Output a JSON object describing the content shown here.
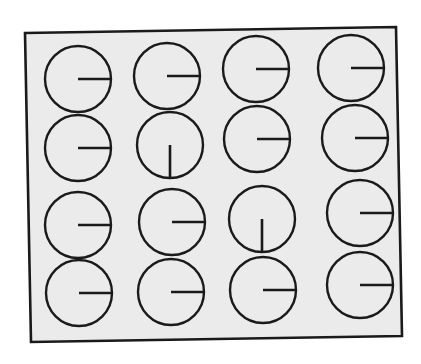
{
  "diagram": {
    "type": "visual-search-stimulus",
    "grid": {
      "rows": 4,
      "cols": 4
    },
    "colors": {
      "background": "#ffffff",
      "panel_fill": "#ebebeb",
      "stroke": "#1a1a1a"
    },
    "frame": {
      "corners": [
        [
          25,
          33
        ],
        [
          396,
          27
        ],
        [
          402,
          336
        ],
        [
          31,
          342
        ]
      ]
    },
    "circle_radius": 33,
    "items": [
      {
        "row": 1,
        "col": 1,
        "cx": 78,
        "cy": 79,
        "line_direction": "right"
      },
      {
        "row": 1,
        "col": 2,
        "cx": 167,
        "cy": 76,
        "line_direction": "right"
      },
      {
        "row": 1,
        "col": 3,
        "cx": 256,
        "cy": 69,
        "line_direction": "right"
      },
      {
        "row": 1,
        "col": 4,
        "cx": 351,
        "cy": 68,
        "line_direction": "right"
      },
      {
        "row": 2,
        "col": 1,
        "cx": 78,
        "cy": 148,
        "line_direction": "right"
      },
      {
        "row": 2,
        "col": 2,
        "cx": 170,
        "cy": 145,
        "line_direction": "down"
      },
      {
        "row": 2,
        "col": 3,
        "cx": 257,
        "cy": 139,
        "line_direction": "right"
      },
      {
        "row": 2,
        "col": 4,
        "cx": 355,
        "cy": 138,
        "line_direction": "right"
      },
      {
        "row": 3,
        "col": 1,
        "cx": 78,
        "cy": 225,
        "line_direction": "right"
      },
      {
        "row": 3,
        "col": 2,
        "cx": 172,
        "cy": 222,
        "line_direction": "right"
      },
      {
        "row": 3,
        "col": 3,
        "cx": 262,
        "cy": 219,
        "line_direction": "down"
      },
      {
        "row": 3,
        "col": 4,
        "cx": 360,
        "cy": 213,
        "line_direction": "right"
      },
      {
        "row": 4,
        "col": 1,
        "cx": 79,
        "cy": 293,
        "line_direction": "right"
      },
      {
        "row": 4,
        "col": 2,
        "cx": 171,
        "cy": 292,
        "line_direction": "right"
      },
      {
        "row": 4,
        "col": 3,
        "cx": 263,
        "cy": 290,
        "line_direction": "right"
      },
      {
        "row": 4,
        "col": 4,
        "cx": 360,
        "cy": 285,
        "line_direction": "right"
      }
    ],
    "summary": {
      "total_items": 16,
      "distractors_right": 14,
      "targets_down": 2
    }
  }
}
